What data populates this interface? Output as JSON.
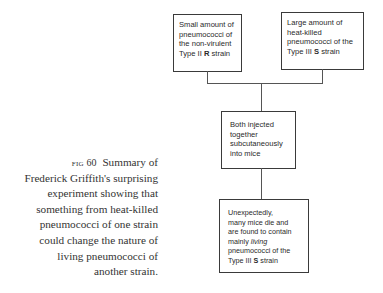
{
  "diagram": {
    "boxes": {
      "r_strain": {
        "line1": "Small amount of",
        "line2": "pneumococci of",
        "line3": "the non-virulent",
        "line4_pre": "Type II ",
        "line4_bold": "R",
        "line4_post": " strain"
      },
      "s_strain": {
        "line1": "Large amount of",
        "line2": "heat-killed",
        "line3": "pneumococci of the",
        "line4_pre": "Type III ",
        "line4_bold": "S",
        "line4_post": " strain"
      },
      "injection": {
        "line1": "Both injected",
        "line2": "together",
        "line3": "subcutaneously",
        "line4": "into mice"
      },
      "result": {
        "line1": "Unexpectedly,",
        "line2": "many mice die and",
        "line3": "are found to contain",
        "line4_pre": "mainly ",
        "line4_italic": "living",
        "line5": "pneumococci of the",
        "line6_pre": "Type III ",
        "line6_bold": "S",
        "line6_post": " strain"
      }
    }
  },
  "caption": {
    "label": "fig 60",
    "lines": [
      "Summary of",
      "Frederick Griffith's surprising",
      "experiment showing that",
      "something from heat-killed",
      "pneumococci of one strain",
      "could change the nature of",
      "living pneumococci of",
      "another strain."
    ]
  },
  "colors": {
    "border": "#3a3a3a",
    "text": "#2a2a2a",
    "caption_text": "#333333"
  }
}
